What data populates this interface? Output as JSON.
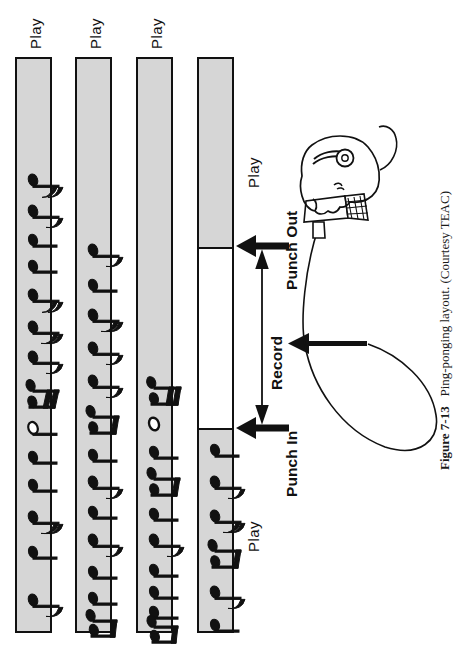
{
  "figure": {
    "number": "Figure 7-13",
    "caption": "Ping-ponging layout. (Courtesy TEAC)"
  },
  "labels": {
    "play": "Play",
    "record": "Record",
    "punch_in": "Punch In",
    "punch_out": "Punch Out"
  },
  "colors": {
    "track_fill": "#d6d6d6",
    "record_fill": "#ffffff",
    "outline": "#111111",
    "page_background": "#ffffff"
  },
  "tracks": [
    {
      "id": "track-1",
      "label": "Play",
      "mode": "play",
      "notes": 13,
      "segments": [
        {
          "type": "play",
          "label": "Play"
        }
      ]
    },
    {
      "id": "track-2",
      "label": "Play",
      "mode": "play",
      "notes": 13,
      "segments": [
        {
          "type": "play",
          "label": "Play"
        }
      ]
    },
    {
      "id": "track-3",
      "label": "Play",
      "mode": "play",
      "notes": 11,
      "segments": [
        {
          "type": "play",
          "label": "Play"
        }
      ]
    },
    {
      "id": "track-4",
      "label": "",
      "mode": "punch",
      "notes": 6,
      "segments": [
        {
          "type": "play",
          "label": "Play"
        },
        {
          "type": "record",
          "label": "Record"
        },
        {
          "type": "play",
          "label": "Play"
        }
      ]
    }
  ],
  "annotations": [
    {
      "name": "punch-out-marker",
      "text": "Punch Out"
    },
    {
      "name": "record-span",
      "text": "Record"
    },
    {
      "name": "punch-in-marker",
      "text": "Punch In"
    }
  ],
  "illustration": {
    "head": "head-with-headphones",
    "microphone": "microphone-icon",
    "cable": "mic-cable-loop",
    "mic_arrow": "mic-input-arrow"
  }
}
